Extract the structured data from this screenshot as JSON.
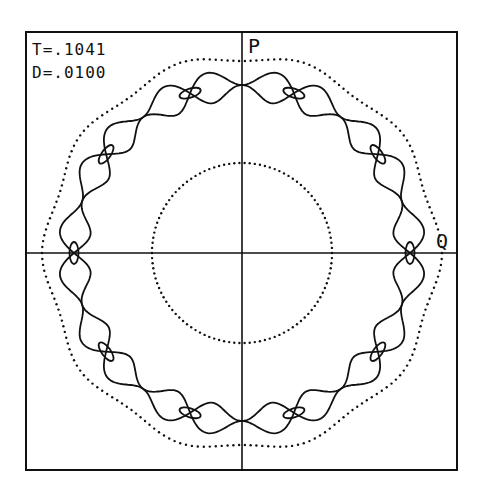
{
  "chart_data": {
    "type": "scatter",
    "title": "",
    "subtitle": "",
    "annotations": [
      {
        "text": "T=.1041",
        "position": "top-left"
      },
      {
        "text": "D=.0100",
        "position": "top-left"
      }
    ],
    "xlabel": "Q",
    "ylabel": "P",
    "axes": "centered crosshair, no ticks",
    "grid": false,
    "legend": null,
    "frame": {
      "left": 26,
      "top": 32,
      "right": 457,
      "bottom": 470
    },
    "origin_px": {
      "x": 242,
      "y": 253
    },
    "series": [
      {
        "name": "inner invariant circle",
        "style": "dotted",
        "shape": "circle",
        "radius_px": 90
      },
      {
        "name": "separatrix chain",
        "style": "solid",
        "order": 10,
        "x_point_radius_px": 168,
        "x_point_angles_deg": [
          18,
          54,
          90,
          126,
          162,
          198,
          234,
          270,
          306,
          342
        ],
        "lobe_half_width_px": 20
      },
      {
        "name": "island orbits",
        "style": "solid",
        "count": 10,
        "o_point_radius_px": 168,
        "o_point_angles_deg": [
          0,
          36,
          72,
          108,
          144,
          180,
          216,
          252,
          288,
          324
        ],
        "ellipse_semi_axes_px": [
          11,
          4.5
        ]
      },
      {
        "name": "outer invariant curve",
        "style": "dotted",
        "mean_radius_px": 196,
        "wobble_px": 4,
        "order": 10
      }
    ]
  },
  "labels": {
    "t_param": "T=.1041",
    "d_param": "D=.0100",
    "axis_p": "P",
    "axis_q": "Q"
  },
  "colors": {
    "ink": "#111111",
    "background": "#ffffff"
  }
}
